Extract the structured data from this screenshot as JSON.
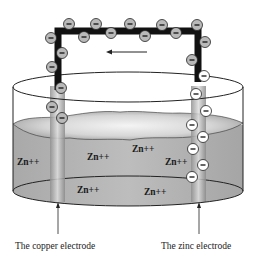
{
  "diagram": {
    "type": "electrochemical cell",
    "flow_arrow_direction": "left",
    "electron_symbol": "−",
    "ions": [
      {
        "label": "Zn++",
        "x": 17,
        "y": 165
      },
      {
        "label": "Zn++",
        "x": 87,
        "y": 160
      },
      {
        "label": "Zn++",
        "x": 132,
        "y": 152
      },
      {
        "label": "Zn++",
        "x": 165,
        "y": 165
      },
      {
        "label": "Zn++",
        "x": 77,
        "y": 193
      },
      {
        "label": "Zn++",
        "x": 144,
        "y": 195
      }
    ],
    "electrodes": {
      "copper": {
        "label": "The copper electrode"
      },
      "zinc": {
        "label": "The zinc electrode"
      }
    },
    "colors": {
      "wire": "#111111",
      "solution": "#b4b4b4",
      "electron_fill_on_wire": "#b9b9b9",
      "electron_fill_on_zinc": "#ffffff",
      "beaker_outline": "#222222",
      "electrode": "#a9a9a9"
    }
  }
}
